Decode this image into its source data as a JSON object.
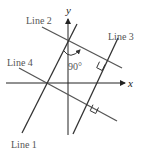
{
  "diagram": {
    "type": "coordinate-plane-lines",
    "axes": {
      "x_label": "x",
      "y_label": "y",
      "color": "#222222"
    },
    "lines": [
      {
        "name": "Line 1",
        "label": "Line 1",
        "color": "#333333"
      },
      {
        "name": "Line 2",
        "label": "Line 2",
        "color": "#555555"
      },
      {
        "name": "Line 3",
        "label": "Line 3",
        "color": "#333333"
      },
      {
        "name": "Line 4",
        "label": "Line 4",
        "color": "#555555"
      }
    ],
    "angle_label": "90°",
    "annotations": [
      "Line 1 and Line 3 are parallel",
      "Line 2 and Line 4 are parallel",
      "Right angle marks where Line 3 meets Line 2 and Line 4",
      "90° arc between Line 1 and Line 2 near the y-axis"
    ]
  }
}
